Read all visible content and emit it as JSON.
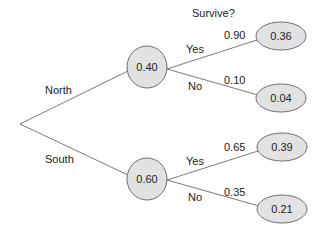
{
  "title": "Survive?",
  "colors": {
    "node_fill": "#e2e2e2",
    "node_stroke": "#6e6e6e",
    "edge": "#7a7a7a",
    "text": "#222222"
  },
  "root": {
    "x": 20,
    "y": 124
  },
  "branches": [
    {
      "label": "North",
      "node": {
        "value": "0.40",
        "cx": 147,
        "cy": 67
      },
      "outcomes": [
        {
          "label": "Yes",
          "prob": "0.90",
          "result": "0.36",
          "cx": 281,
          "cy": 36
        },
        {
          "label": "No",
          "prob": "0.10",
          "result": "0.04",
          "cx": 281,
          "cy": 98
        }
      ]
    },
    {
      "label": "South",
      "node": {
        "value": "0.60",
        "cx": 147,
        "cy": 179
      },
      "outcomes": [
        {
          "label": "Yes",
          "prob": "0.65",
          "result": "0.39",
          "cx": 282,
          "cy": 147
        },
        {
          "label": "No",
          "prob": "0.35",
          "result": "0.21",
          "cx": 282,
          "cy": 209
        }
      ]
    }
  ]
}
